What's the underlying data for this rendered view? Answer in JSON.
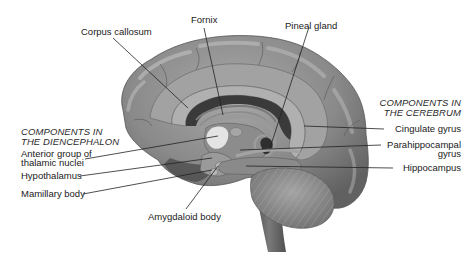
{
  "diagram": {
    "colors": {
      "background": "#ffffff",
      "cortex": "#8a8a8a",
      "cortex_highlight": "#b4b4b4",
      "cortex_shadow": "#5a5a5a",
      "cingulate_band": "#9c9c9c",
      "corpus_callosum": "#a6a6a6",
      "ventricle": "#3c3c3c",
      "thalamus_highlight": "#e6e6e6",
      "cerebellum": "#8e8e8e",
      "brainstem": "#6e6e6e",
      "label_text": "#1a1a1a",
      "leader_line": "#222222"
    },
    "top_labels": {
      "corpus_callosum": "Corpus callosum",
      "fornix": "Fornix",
      "pineal_gland": "Pineal gland"
    },
    "diencephalon": {
      "heading_line1": "COMPONENTS IN",
      "heading_line2": "THE DIENCEPHALON",
      "items": [
        {
          "label_line1": "Anterior group of",
          "label_line2": "thalamic nuclei"
        },
        {
          "label_line1": "Hypothalamus"
        },
        {
          "label_line1": "Mamillary body"
        }
      ]
    },
    "cerebrum": {
      "heading_line1": "COMPONENTS IN",
      "heading_line2": "THE CEREBRUM",
      "items": [
        {
          "label_line1": "Cingulate gyrus"
        },
        {
          "label_line1": "Parahippocampal",
          "label_line2": "gyrus"
        },
        {
          "label_line1": "Hippocampus"
        }
      ]
    },
    "bottom_labels": {
      "amygdaloid_body": "Amygdaloid body"
    }
  }
}
